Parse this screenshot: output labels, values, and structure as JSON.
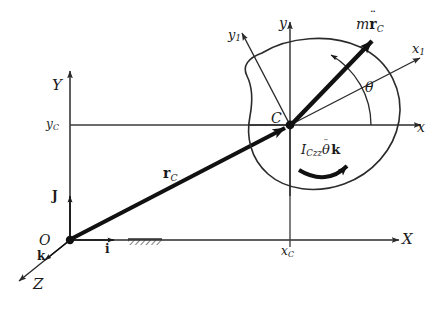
{
  "figure": {
    "background": "#ffffff",
    "stroke_color": "#2b2b2b",
    "bold_stroke_color": "#111111"
  },
  "global_frame": {
    "origin_label": "O",
    "axes": [
      {
        "name": "X-axis",
        "label": "X"
      },
      {
        "name": "Y-axis",
        "label": "Y"
      },
      {
        "name": "Z-axis",
        "label": "Z"
      }
    ],
    "unit_vectors": [
      {
        "name": "i-hat",
        "label": "i"
      },
      {
        "name": "j-hat",
        "label": "J"
      },
      {
        "name": "k-hat",
        "label": "k"
      }
    ],
    "tick_labels": [
      {
        "name": "y-c-tick",
        "label": "y",
        "sub": "C"
      },
      {
        "name": "x-c-tick",
        "label": "x",
        "sub": "C"
      }
    ],
    "ground_support": "hatched-ground"
  },
  "body_frame": {
    "center_label": "C",
    "axes": [
      {
        "name": "x-axis-local",
        "label": "x"
      },
      {
        "name": "y-axis-local",
        "label": "y"
      },
      {
        "name": "x1-axis-body",
        "label": "x",
        "sub": "1"
      },
      {
        "name": "y1-axis-body",
        "label": "y",
        "sub": "1"
      }
    ],
    "angle_label": "θ"
  },
  "vectors": [
    {
      "name": "position-vector-rc",
      "label_base": "r",
      "label_sub": "C",
      "description": "Position vector from O to mass center C"
    },
    {
      "name": "inertia-force-vector",
      "label_mass": "m",
      "label_base": "r",
      "label_sub": "C",
      "double_dot": "¨",
      "description": "Effective force m r-double-dot sub C at mass center"
    }
  ],
  "moment": {
    "name": "inertia-couple",
    "inertia_symbol": "I",
    "inertia_sub": "Czz",
    "theta_symbol": "θ",
    "double_dot": "¨",
    "k_symbol": "k",
    "description": "Inertia couple I_Czz theta-double-dot k"
  }
}
